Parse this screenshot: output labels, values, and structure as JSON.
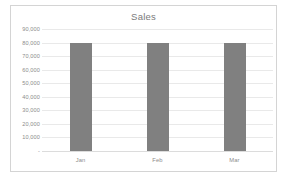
{
  "chart_data": {
    "type": "bar",
    "title": "Sales",
    "categories": [
      "Jan",
      "Feb",
      "Mar"
    ],
    "values": [
      80000,
      80000,
      80000
    ],
    "series": [
      {
        "name": "Sales",
        "values": [
          80000,
          80000,
          80000
        ]
      }
    ],
    "xlabel": "",
    "ylabel": "",
    "ylim": [
      0,
      90000
    ],
    "ytick_values": [
      90000,
      80000,
      70000,
      60000,
      50000,
      40000,
      30000,
      20000,
      10000,
      0
    ],
    "ytick_labels": [
      "90,000",
      "80,000",
      "70,000",
      "60,000",
      "50,000",
      "40,000",
      "30,000",
      "20,000",
      "10,000",
      "-"
    ],
    "grid": true,
    "legend": false,
    "legend_position": "none",
    "colors": {
      "bar": "#808080",
      "gridline": "#e9e9e9",
      "axis_text": "#8c8c8c",
      "title_text": "#7a7a7a",
      "frame_border": "#d4d4d4",
      "plot_background": "#ffffff"
    }
  }
}
